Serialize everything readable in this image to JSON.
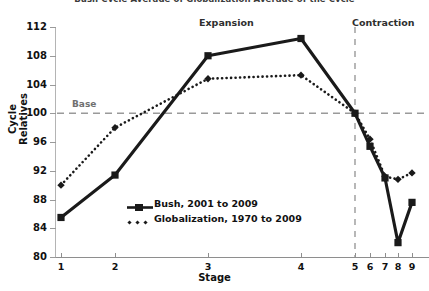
{
  "chart_data": {
    "type": "line",
    "title": "Bush Cycle Average of Globalization Average of the Cycle",
    "xlabel": "Stage",
    "ylabel": "Cycle Relatives",
    "ylim": [
      80,
      112
    ],
    "yticks": [
      80,
      84,
      88,
      92,
      96,
      100,
      104,
      108,
      112
    ],
    "categories": [
      "1",
      "2",
      "3",
      "4",
      "5",
      "6",
      "7",
      "8",
      "9"
    ],
    "x_positions": [
      61,
      115,
      208,
      301,
      355,
      370,
      385,
      398,
      412
    ],
    "grid": false,
    "legend_position": "inside-lower-left",
    "series": [
      {
        "name": "Bush, 2001 to 2009",
        "marker": "square",
        "linestyle": "solid",
        "color": "#1a1a1a",
        "values": [
          85.5,
          91.4,
          108.0,
          110.4,
          100.0,
          95.4,
          91.0,
          82.0,
          87.6
        ]
      },
      {
        "name": "Globalization, 1970 to 2009",
        "marker": "diamond",
        "linestyle": "dotted",
        "color": "#1a1a1a",
        "values": [
          90.0,
          98.0,
          104.8,
          105.3,
          100.0,
          96.4,
          91.2,
          90.8,
          91.7
        ]
      }
    ],
    "annotations": [
      {
        "name": "base-line",
        "label": "Base",
        "type": "hline",
        "value": 100,
        "style": "dashed",
        "color": "#9a9a9a"
      },
      {
        "name": "cycle-divider",
        "label": "",
        "type": "vline",
        "value": 5,
        "style": "dashed",
        "color": "#9a9a9a"
      },
      {
        "name": "expansion-band",
        "label": "Expansion",
        "type": "text"
      },
      {
        "name": "contraction-band",
        "label": "Contraction",
        "type": "text"
      }
    ]
  },
  "colors": {
    "series": "#1a1a1a",
    "axis": "#8e8e8e",
    "guide": "#9a9a9a",
    "background": "#ffffff"
  }
}
